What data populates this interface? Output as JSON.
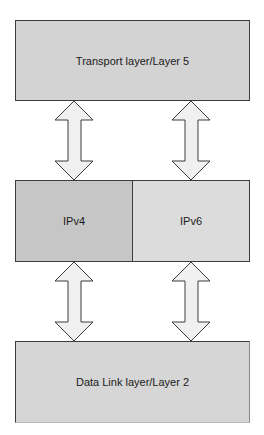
{
  "diagram": {
    "layers": {
      "transport": "Transport layer/Layer 5",
      "ipv4": "IPv4",
      "ipv6": "IPv6",
      "datalink": "Data Link layer/Layer 2"
    },
    "connections": [
      {
        "from": "transport",
        "to": "ipv4",
        "type": "bidirectional-arrow"
      },
      {
        "from": "transport",
        "to": "ipv6",
        "type": "bidirectional-arrow"
      },
      {
        "from": "ipv4",
        "to": "datalink",
        "type": "bidirectional-arrow"
      },
      {
        "from": "ipv6",
        "to": "datalink",
        "type": "bidirectional-arrow"
      }
    ],
    "colors": {
      "transport_fill": "#d3d3d3",
      "ipv4_fill": "#c6c6c6",
      "ipv6_fill": "#dcdcdc",
      "datalink_fill": "#d6d6d6",
      "arrow_fill": "#f0f0f0",
      "stroke": "#3c3c3c"
    }
  }
}
